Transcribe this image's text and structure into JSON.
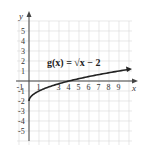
{
  "chart_data": {
    "type": "line",
    "title": "g(x) = √x − 2",
    "function_label": "g(x) = √x − 2",
    "xlabel": "x",
    "ylabel": "y",
    "xlim": [
      -1,
      10
    ],
    "ylim": [
      -6,
      6
    ],
    "grid": true,
    "x_ticks": [
      "-1",
      "1",
      "3",
      "4",
      "5",
      "6",
      "7",
      "8",
      "9"
    ],
    "y_ticks": [
      "5",
      "4",
      "3",
      "2",
      "1",
      "-1",
      "-2",
      "-3",
      "-4",
      "-5"
    ],
    "series": [
      {
        "name": "g(x) = √x − 2",
        "x": [
          0,
          0.25,
          1,
          2,
          4,
          6,
          8,
          9,
          10
        ],
        "y": [
          -2,
          -1.5,
          -1,
          -0.59,
          0,
          0.45,
          0.83,
          1,
          1.16
        ]
      }
    ],
    "colors": {
      "curve": "#222222",
      "grid": "#d8d8d8",
      "axis": "#444444"
    }
  }
}
